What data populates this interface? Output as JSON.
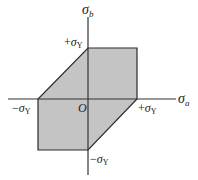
{
  "diagram": {
    "colors": {
      "fill": "#c4c4c4",
      "stroke": "#2a2a2a",
      "axis": "#333333"
    },
    "axes": {
      "horizontal": {
        "symbol": "σ",
        "subscript": "a"
      },
      "vertical": {
        "symbol": "σ",
        "subscript": "b"
      }
    },
    "origin_label": "O",
    "ticks": {
      "pos_x": {
        "sign": "+",
        "symbol": "σ",
        "subscript": "Y"
      },
      "neg_x": {
        "sign": "−",
        "symbol": "σ",
        "subscript": "Y"
      },
      "pos_y": {
        "sign": "+",
        "symbol": "σ",
        "subscript": "Y"
      },
      "neg_y": {
        "sign": "−",
        "symbol": "σ",
        "subscript": "Y"
      }
    }
  }
}
